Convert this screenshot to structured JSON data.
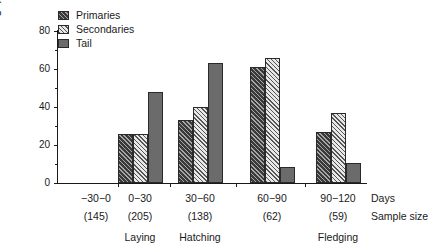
{
  "chart_data": {
    "type": "bar",
    "title": "",
    "subtitle": "",
    "xlabel": "Days",
    "ylabel": "Moulting (%)",
    "ylim": [
      0,
      80
    ],
    "yticks": [
      0,
      20,
      40,
      60,
      80
    ],
    "yticks_minor": [
      10,
      30,
      50,
      70
    ],
    "grid": false,
    "legend_position": "top-left",
    "categories": [
      "−30−0",
      "0−30",
      "30−60",
      "60−90",
      "90−120"
    ],
    "sample_sizes": [
      "(145)",
      "(205)",
      "(138)",
      "(62)",
      "(59)"
    ],
    "series": [
      {
        "name": "Primaries",
        "values": [
          0,
          26,
          33,
          61,
          27
        ]
      },
      {
        "name": "Secondaries",
        "values": [
          0,
          26,
          40,
          66,
          37
        ]
      },
      {
        "name": "Tail",
        "values": [
          0,
          48,
          63,
          8.5,
          10.5
        ]
      }
    ],
    "annotations": [
      {
        "text": "Laying",
        "category": "0−30"
      },
      {
        "text": "Hatching",
        "category": "30−60"
      },
      {
        "text": "Fledging",
        "category": "90−120"
      }
    ],
    "row_labels": {
      "days": "Days",
      "sample_size": "Sample size"
    }
  },
  "legend": {
    "items": [
      {
        "label": "Primaries",
        "swatch": "dark-hatch-swatch"
      },
      {
        "label": "Secondaries",
        "swatch": "light-hatch-swatch"
      },
      {
        "label": "Tail",
        "swatch": "solid-gray-swatch"
      }
    ]
  },
  "axis": {
    "y_label": "Moulting (%)",
    "y_tick_labels": [
      "0",
      "20",
      "40",
      "60",
      "80"
    ]
  }
}
